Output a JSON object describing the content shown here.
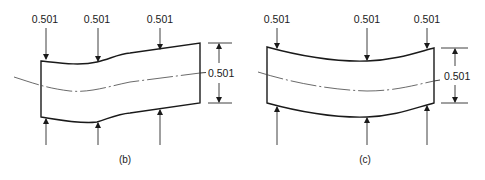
{
  "figures": [
    {
      "id": "b",
      "caption": "(b)",
      "top_loads": [
        {
          "label": "0.501"
        },
        {
          "label": "0.501"
        },
        {
          "label": "0.501"
        }
      ],
      "thickness_dimension": {
        "label": "0.501"
      },
      "shape": "beam with S-shaped (kinked) deflection, thickness constant"
    },
    {
      "id": "c",
      "caption": "(c)",
      "top_loads": [
        {
          "label": "0.501"
        },
        {
          "label": "0.501"
        },
        {
          "label": "0.501"
        }
      ],
      "thickness_dimension": {
        "label": "0.501"
      },
      "shape": "beam with uniform sag (bowed) deflection, thickness constant"
    }
  ],
  "colors": {
    "line": "#1a1a1a",
    "background": "#ffffff"
  }
}
